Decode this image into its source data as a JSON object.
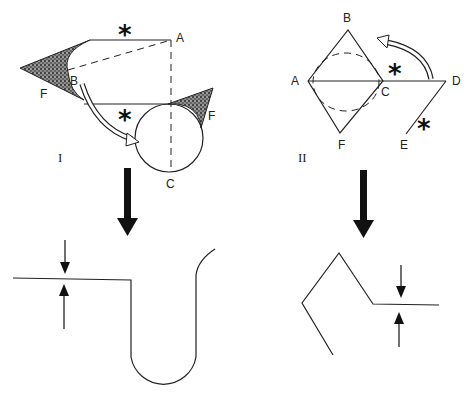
{
  "panel_I": {
    "numeral": "I",
    "labels": {
      "A": "A",
      "B": "B",
      "C": "C",
      "F_left": "F",
      "F_right": "F"
    },
    "markers": {
      "star_top": "*",
      "star_mid": "*"
    }
  },
  "panel_II": {
    "numeral": "II",
    "labels": {
      "A": "A",
      "B": "B",
      "C": "C",
      "D": "D",
      "E": "E",
      "F": "F"
    },
    "markers": {
      "star_CD": "*",
      "star_DE": "*"
    }
  },
  "colors": {
    "line": "#222222",
    "fill_shade": "#555555",
    "arrow": "#111111"
  }
}
